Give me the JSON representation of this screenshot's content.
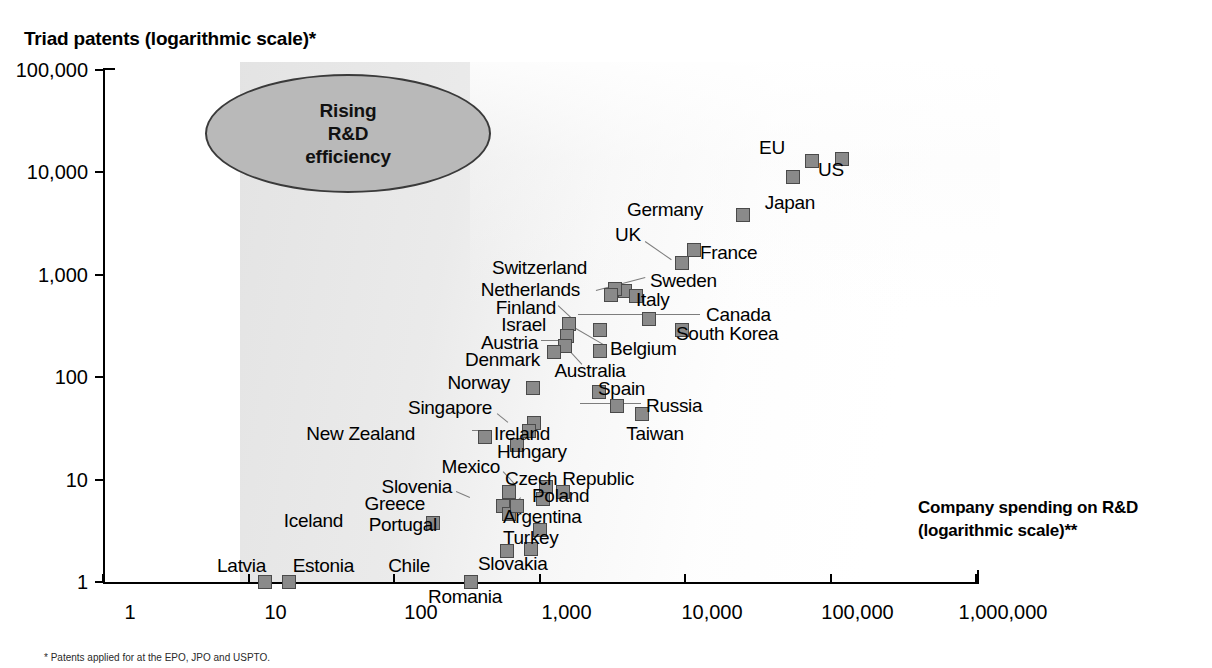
{
  "chart_data": {
    "type": "scatter",
    "title": "Triad patents (logarithmic scale)*",
    "xlabel": "Company spending on R&D (logarithmic scale)**",
    "ylabel": "Triad patents (logarithmic scale)*",
    "xscale": "log",
    "yscale": "log",
    "xlim": [
      1,
      1000000
    ],
    "ylim": [
      1,
      100000
    ],
    "grid": false,
    "legend": null,
    "x_ticks": [
      "1",
      "10",
      "100",
      "1,000",
      "10,000",
      "100,000",
      "1,000,000"
    ],
    "y_ticks": [
      "1",
      "10",
      "100",
      "1,000",
      "10,000",
      "100,000"
    ],
    "annotation": {
      "text": "Rising\nR&D\nefficiency",
      "line1": "Rising",
      "line2": "R&D",
      "line3": "efficiency",
      "shape": "ellipse"
    },
    "points": [
      {
        "name": "US",
        "x": 120000,
        "y": 13500
      },
      {
        "name": "EU",
        "x": 75000,
        "y": 13000
      },
      {
        "name": "Japan",
        "x": 55000,
        "y": 9000
      },
      {
        "name": "Germany",
        "x": 25000,
        "y": 3800
      },
      {
        "name": "France",
        "x": 11500,
        "y": 1750
      },
      {
        "name": "UK",
        "x": 9500,
        "y": 1300
      },
      {
        "name": "Sweden",
        "x": 3900,
        "y": 700
      },
      {
        "name": "Switzerland",
        "x": 3300,
        "y": 720
      },
      {
        "name": "Netherlands",
        "x": 3100,
        "y": 640
      },
      {
        "name": "Italy",
        "x": 4600,
        "y": 620
      },
      {
        "name": "Canada",
        "x": 5700,
        "y": 370
      },
      {
        "name": "South Korea",
        "x": 9500,
        "y": 290
      },
      {
        "name": "Finland",
        "x": 1600,
        "y": 330
      },
      {
        "name": "Israel",
        "x": 1550,
        "y": 250
      },
      {
        "name": "Belgium",
        "x": 2600,
        "y": 290
      },
      {
        "name": "Austria",
        "x": 1500,
        "y": 200
      },
      {
        "name": "Denmark",
        "x": 1250,
        "y": 175
      },
      {
        "name": "Australia",
        "x": 2600,
        "y": 180
      },
      {
        "name": "Norway",
        "x": 900,
        "y": 78
      },
      {
        "name": "Spain",
        "x": 2550,
        "y": 72
      },
      {
        "name": "Russia",
        "x": 5100,
        "y": 44
      },
      {
        "name": "Taiwan",
        "x": 3400,
        "y": 52
      },
      {
        "name": "Singapore",
        "x": 920,
        "y": 36
      },
      {
        "name": "Ireland",
        "x": 850,
        "y": 30
      },
      {
        "name": "New Zealand",
        "x": 420,
        "y": 26
      },
      {
        "name": "Hungary",
        "x": 700,
        "y": 22
      },
      {
        "name": "Mexico",
        "x": 1100,
        "y": 8.5
      },
      {
        "name": "Czech Republic",
        "x": 1050,
        "y": 6.5
      },
      {
        "name": "Poland",
        "x": 1450,
        "y": 7.5
      },
      {
        "name": "Slovenia",
        "x": 620,
        "y": 7.5
      },
      {
        "name": "Greece",
        "x": 560,
        "y": 5.5
      },
      {
        "name": "Portugal",
        "x": 620,
        "y": 4.6
      },
      {
        "name": "Argentina",
        "x": 700,
        "y": 5.5
      },
      {
        "name": "Turkey",
        "x": 1000,
        "y": 3.2
      },
      {
        "name": "Iceland",
        "x": 185,
        "y": 3.8
      },
      {
        "name": "Chile",
        "x": 600,
        "y": 2.0
      },
      {
        "name": "Slovakia",
        "x": 880,
        "y": 2.1
      },
      {
        "name": "Latvia",
        "x": 13,
        "y": 1.0
      },
      {
        "name": "Estonia",
        "x": 19,
        "y": 1.0
      },
      {
        "name": "Romania",
        "x": 340,
        "y": 1.0
      }
    ]
  },
  "labels": {
    "US": "US",
    "EU": "EU",
    "Japan": "Japan",
    "Germany": "Germany",
    "France": "France",
    "UK": "UK",
    "Sweden": "Sweden",
    "Switzerland": "Switzerland",
    "Netherlands": "Netherlands",
    "Italy": "Italy",
    "Canada": "Canada",
    "South Korea": "South Korea",
    "Finland": "Finland",
    "Israel": "Israel",
    "Belgium": "Belgium",
    "Austria": "Austria",
    "Denmark": "Denmark",
    "Australia": "Australia",
    "Norway": "Norway",
    "Spain": "Spain",
    "Russia": "Russia",
    "Taiwan": "Taiwan",
    "Singapore": "Singapore",
    "Ireland": "Ireland",
    "New Zealand": "New Zealand",
    "Hungary": "Hungary",
    "Mexico": "Mexico",
    "Czech Republic": "Czech Republic",
    "Poland": "Poland",
    "Slovenia": "Slovenia",
    "Greece": "Greece",
    "Portugal": "Portugal",
    "Argentina": "Argentina",
    "Turkey": "Turkey",
    "Iceland": "Iceland",
    "Chile": "Chile",
    "Slovakia": "Slovakia",
    "Latvia": "Latvia",
    "Estonia": "Estonia",
    "Romania": "Romania"
  },
  "label_placement": {
    "US": {
      "px": 818,
      "py": 170,
      "align": "l"
    },
    "EU": {
      "px": 772,
      "py": 148,
      "align": "c"
    },
    "Japan": {
      "px": 790,
      "py": 203,
      "align": "c"
    },
    "Germany": {
      "px": 703,
      "py": 210,
      "align": "r"
    },
    "France": {
      "px": 700,
      "py": 253,
      "align": "l"
    },
    "UK": {
      "px": 628,
      "py": 235,
      "align": "c"
    },
    "Sweden": {
      "px": 650,
      "py": 281,
      "align": "l"
    },
    "Switzerland": {
      "px": 587,
      "py": 268,
      "align": "r"
    },
    "Netherlands": {
      "px": 580,
      "py": 290,
      "align": "r"
    },
    "Italy": {
      "px": 636,
      "py": 300,
      "align": "l"
    },
    "Canada": {
      "px": 706,
      "py": 315,
      "align": "l"
    },
    "South Korea": {
      "px": 676,
      "py": 334,
      "align": "l"
    },
    "Finland": {
      "px": 556,
      "py": 308,
      "align": "r"
    },
    "Israel": {
      "px": 546,
      "py": 325,
      "align": "r"
    },
    "Belgium": {
      "px": 610,
      "py": 349,
      "align": "l"
    },
    "Austria": {
      "px": 538,
      "py": 343,
      "align": "r"
    },
    "Denmark": {
      "px": 540,
      "py": 360,
      "align": "r"
    },
    "Australia": {
      "px": 590,
      "py": 371,
      "align": "c"
    },
    "Norway": {
      "px": 510,
      "py": 383,
      "align": "r"
    },
    "Spain": {
      "px": 598,
      "py": 389,
      "align": "l"
    },
    "Russia": {
      "px": 646,
      "py": 406,
      "align": "l"
    },
    "Taiwan": {
      "px": 655,
      "py": 434,
      "align": "c"
    },
    "Singapore": {
      "px": 492,
      "py": 408,
      "align": "r"
    },
    "Ireland": {
      "px": 494,
      "py": 434,
      "align": "l"
    },
    "New Zealand": {
      "px": 415,
      "py": 434,
      "align": "r"
    },
    "Hungary": {
      "px": 497,
      "py": 452,
      "align": "l"
    },
    "Mexico": {
      "px": 500,
      "py": 467,
      "align": "r"
    },
    "Czech Republic": {
      "px": 505,
      "py": 479,
      "align": "l"
    },
    "Poland": {
      "px": 532,
      "py": 496,
      "align": "l"
    },
    "Slovenia": {
      "px": 452,
      "py": 487,
      "align": "r"
    },
    "Greece": {
      "px": 425,
      "py": 504,
      "align": "r"
    },
    "Portugal": {
      "px": 437,
      "py": 525,
      "align": "r"
    },
    "Argentina": {
      "px": 503,
      "py": 517,
      "align": "l"
    },
    "Turkey": {
      "px": 503,
      "py": 538,
      "align": "l"
    },
    "Iceland": {
      "px": 343,
      "py": 521,
      "align": "r"
    },
    "Chile": {
      "px": 430,
      "py": 566,
      "align": "r"
    },
    "Slovakia": {
      "px": 478,
      "py": 564,
      "align": "l"
    },
    "Latvia": {
      "px": 266,
      "py": 566,
      "align": "r"
    },
    "Estonia": {
      "px": 354,
      "py": 566,
      "align": "r"
    },
    "Romania": {
      "px": 465,
      "py": 597,
      "align": "c"
    }
  },
  "leaders": [
    {
      "name": "leader-uk",
      "x1": 645,
      "y1": 241,
      "x2": 671,
      "y2": 259
    },
    {
      "name": "leader-sweden",
      "x1": 596,
      "y1": 290,
      "x2": 645,
      "y2": 277
    },
    {
      "name": "leader-canada",
      "x1": 578,
      "y1": 314,
      "x2": 700,
      "y2": 314
    },
    {
      "name": "leader-finland",
      "x1": 558,
      "y1": 305,
      "x2": 573,
      "y2": 319
    },
    {
      "name": "leader-belgium",
      "x1": 574,
      "y1": 327,
      "x2": 605,
      "y2": 345
    },
    {
      "name": "leader-australia",
      "x1": 571,
      "y1": 352,
      "x2": 582,
      "y2": 364
    },
    {
      "name": "leader-austria",
      "x1": 541,
      "y1": 340,
      "x2": 558,
      "y2": 340
    },
    {
      "name": "leader-russia",
      "x1": 580,
      "y1": 403,
      "x2": 641,
      "y2": 403
    },
    {
      "name": "leader-singapore",
      "x1": 497,
      "y1": 413,
      "x2": 508,
      "y2": 422
    },
    {
      "name": "leader-ireland",
      "x1": 472,
      "y1": 430,
      "x2": 489,
      "y2": 430
    },
    {
      "name": "leader-mexico",
      "x1": 503,
      "y1": 471,
      "x2": 515,
      "y2": 484
    },
    {
      "name": "leader-argentina",
      "x1": 503,
      "y1": 513,
      "x2": 521,
      "y2": 497
    },
    {
      "name": "leader-slovenia",
      "x1": 456,
      "y1": 491,
      "x2": 470,
      "y2": 497
    }
  ],
  "footnote": "* Patents applied for at the EPO, JPO and USPTO."
}
